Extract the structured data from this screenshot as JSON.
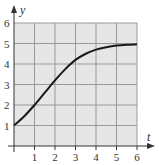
{
  "chart_data": {
    "type": "line",
    "title": "",
    "xlabel": "t",
    "ylabel": "y",
    "x": [
      0,
      0.5,
      1,
      1.5,
      2,
      2.5,
      3,
      3.5,
      4,
      4.5,
      5,
      5.5,
      6
    ],
    "series": [
      {
        "name": "y(t)",
        "values": [
          1.0,
          1.45,
          2.0,
          2.6,
          3.2,
          3.75,
          4.2,
          4.5,
          4.7,
          4.82,
          4.9,
          4.94,
          4.96
        ]
      }
    ],
    "xlim": [
      0,
      6
    ],
    "ylim": [
      0,
      6
    ],
    "x_ticks": [
      "1",
      "2",
      "3",
      "4",
      "5",
      "6"
    ],
    "y_ticks": [
      "1",
      "2",
      "3",
      "4",
      "5",
      "6"
    ],
    "grid": true,
    "legend": "none"
  },
  "colors": {
    "plot_background": "#e6e6e6",
    "grid": "#9a9a9a",
    "axis": "#333333",
    "curve": "#1a1a1a"
  }
}
